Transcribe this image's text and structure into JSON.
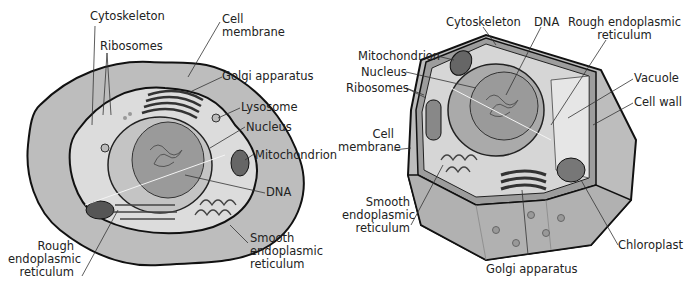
{
  "animal_cell": {
    "labels": {
      "cytoskeleton": "Cytoskeleton",
      "ribosomes": "Ribosomes",
      "cell_membrane": "Cell\nmembrane",
      "golgi": "Golgi apparatus",
      "lysosome": "Lysosome",
      "nucleus": "Nucleus",
      "mitochondrion": "Mitochondrion",
      "dna": "DNA",
      "smooth_er": "Smooth\nendoplasmic\nreticulum",
      "rough_er": "Rough\nendoplasmic\nreticulum"
    }
  },
  "plant_cell": {
    "labels": {
      "cytoskeleton": "Cytoskeleton",
      "dna": "DNA",
      "rough_er": "Rough endoplasmic\nreticulum",
      "mitochondrion": "Mitochondrion",
      "nucleus": "Nucleus",
      "ribosomes": "Ribosomes",
      "vacuole": "Vacuole",
      "cell_wall": "Cell wall",
      "cell_membrane": "Cell\nmembrane",
      "smooth_er": "Smooth\nendoplasmic\nreticulum",
      "chloroplast": "Chloroplast",
      "golgi": "Golgi apparatus"
    }
  },
  "colors": {
    "outer": "#bdbdbd",
    "cytoplasm": "#dcdcdc",
    "nucleus": "#a9a9a9",
    "nucleus_inner": "#9a9a9a",
    "stroke": "#111111",
    "leader": "#333333"
  }
}
